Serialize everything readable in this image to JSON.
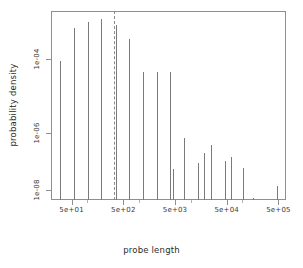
{
  "chart_data": {
    "type": "bar",
    "title": "",
    "subtitle": "",
    "xlabel": "probe length",
    "ylabel": "probability density",
    "xscale": "log",
    "yscale": "log",
    "xlim": [
      20,
      700000
    ],
    "ylim": [
      1e-09,
      0.002
    ],
    "grid": false,
    "legend": null,
    "xticks": [
      {
        "value": 50,
        "label": "5e+01"
      },
      {
        "value": 500,
        "label": "5e+02"
      },
      {
        "value": 5000,
        "label": "5e+03"
      },
      {
        "value": 50000,
        "label": "5e+04"
      },
      {
        "value": 500000,
        "label": "5e+05"
      }
    ],
    "yticks": [
      {
        "value": 0.0001,
        "label": "1e-04"
      },
      {
        "value": 1e-06,
        "label": "1e-06"
      },
      {
        "value": 1e-08,
        "label": "1e-08"
      }
    ],
    "annotations": [
      {
        "kind": "vertical-dashed-line",
        "x": 300,
        "label": ""
      }
    ],
    "x": [
      30,
      50,
      75,
      115,
      175,
      265,
      400,
      620,
      1050,
      1700,
      2700,
      4200,
      6800,
      11000,
      17500,
      29000,
      48000,
      82000,
      430000
    ],
    "values": [
      0.0001,
      0.0006,
      0.001,
      0.0013,
      0.0008,
      0.0003,
      4.5e-05,
      4.5e-05,
      4.5e-05,
      1.2e-07,
      1.2e-07,
      3e-08,
      4e-08,
      3e-08,
      1.2e-08,
      1.2e-08,
      6e-09,
      1.2e-09,
      4e-10
    ],
    "categories": [
      "30",
      "50",
      "75",
      "115",
      "175",
      "265",
      "400",
      "620",
      "1050",
      "1700",
      "2700",
      "4200",
      "6800",
      "11000",
      "17500",
      "29000",
      "48000",
      "82000",
      "430000"
    ],
    "series": [
      {
        "name": "probability density",
        "values": [
          0.0001,
          0.0006,
          0.001,
          0.0013,
          0.0008,
          0.0003,
          4.5e-05,
          4.5e-05,
          4.5e-05,
          1.2e-07,
          1.2e-07,
          3e-08,
          4e-08,
          3e-08,
          1.2e-08,
          1.2e-08,
          6e-09,
          1.2e-09,
          4e-10
        ]
      }
    ],
    "spike_pixels": [
      {
        "x": 60,
        "top": 61
      },
      {
        "x": 74,
        "top": 28
      },
      {
        "x": 88,
        "top": 22
      },
      {
        "x": 101,
        "top": 19
      },
      {
        "x": 116,
        "top": 25
      },
      {
        "x": 129,
        "top": 39
      },
      {
        "x": 143,
        "top": 72
      },
      {
        "x": 157,
        "top": 72
      },
      {
        "x": 170,
        "top": 72
      },
      {
        "x": 173,
        "top": 169
      },
      {
        "x": 184,
        "top": 138
      },
      {
        "x": 198,
        "top": 163
      },
      {
        "x": 204,
        "top": 153
      },
      {
        "x": 211,
        "top": 145
      },
      {
        "x": 225,
        "top": 161
      },
      {
        "x": 231,
        "top": 157
      },
      {
        "x": 243,
        "top": 168
      },
      {
        "x": 253,
        "top": 198
      },
      {
        "x": 277,
        "top": 186
      }
    ]
  }
}
